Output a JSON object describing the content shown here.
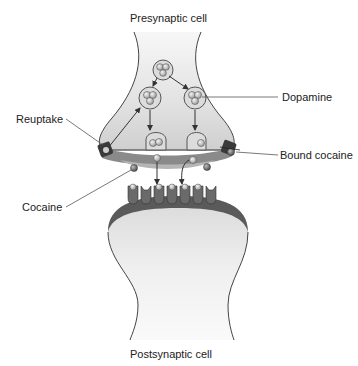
{
  "labels": {
    "presynaptic": "Presynaptic cell",
    "postsynaptic": "Postsynaptic cell",
    "reuptake": "Reuptake",
    "dopamine": "Dopamine",
    "bound_cocaine": "Bound cocaine",
    "cocaine": "Cocaine"
  },
  "colors": {
    "cell_fill": "#e6e6e6",
    "membrane_dark": "#555555",
    "membrane_mid": "#8a8a8a",
    "vesicle": "#d8d8d8",
    "dopamine": "#bdbdbd",
    "cocaine": "#7a7a7a",
    "line": "#444444"
  }
}
